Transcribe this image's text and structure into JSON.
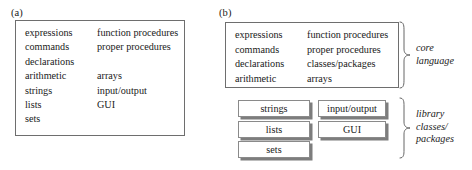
{
  "figure": {
    "panels": [
      {
        "id": "a",
        "label": "(a)",
        "box": {
          "rows": [
            {
              "left": "expressions",
              "right": "function procedures"
            },
            {
              "left": "commands",
              "right": "proper procedures"
            },
            {
              "left": "declarations",
              "right": ""
            },
            {
              "left": "arithmetic",
              "right": "arrays"
            },
            {
              "left": "strings",
              "right": "input/output"
            },
            {
              "left": "lists",
              "right": "GUI"
            },
            {
              "left": "sets",
              "right": ""
            }
          ]
        }
      },
      {
        "id": "b",
        "label": "(b)",
        "core_box": {
          "rows": [
            {
              "left": "expressions",
              "right": "function procedures"
            },
            {
              "left": "commands",
              "right": "proper procedures"
            },
            {
              "left": "declarations",
              "right": "classes/packages"
            },
            {
              "left": "arithmetic",
              "right": "arrays"
            }
          ]
        },
        "library_boxes": {
          "column_left": [
            {
              "label": "strings"
            },
            {
              "label": "lists"
            },
            {
              "label": "sets"
            }
          ],
          "column_right": [
            {
              "label": "input/output"
            },
            {
              "label": "GUI"
            }
          ]
        },
        "annotations": {
          "core": {
            "line1": "core",
            "line2": "language"
          },
          "library": {
            "line1": "library",
            "line2": "classes/",
            "line3": "packages"
          }
        }
      }
    ]
  },
  "colors": {
    "box_border": "#6e6e6e",
    "shadow_box_border": "#8a8a8a",
    "shadow": "#7d7d7d",
    "text": "#1a1a1a",
    "background": "#ffffff"
  }
}
